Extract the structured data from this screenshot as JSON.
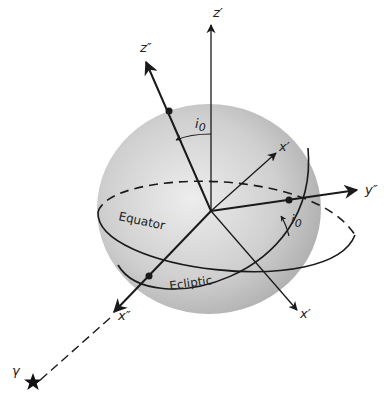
{
  "figure": {
    "type": "celestial-coordinate-sphere",
    "axes": {
      "z_prime": "z′",
      "z_double_prime": "z″",
      "x_prime_upper": "x′",
      "y_double_prime": "y″",
      "x_prime_lower": "x′",
      "x_double_prime": "x″"
    },
    "angles": {
      "inclination_top": "i",
      "inclination_top_sub": "0",
      "inclination_right": "i",
      "inclination_right_sub": "0"
    },
    "circles": {
      "equator": "Equator",
      "ecliptic": "Ecliptic"
    },
    "vernal_equinox": {
      "label": "γ",
      "marker": "star-icon"
    },
    "colors": {
      "sphere_light": "#e6e6e6",
      "sphere_dark": "#a8a8a8",
      "line": "#1a1a1a"
    }
  }
}
